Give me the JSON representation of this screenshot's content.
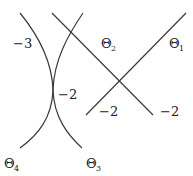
{
  "diagram": {
    "labels": {
      "left_region": "−3",
      "center_touch": "−2",
      "line_left_end": "−2",
      "line_right_end": "−2",
      "theta1": {
        "base": "Θ",
        "sub": "1"
      },
      "theta2": {
        "base": "Θ",
        "sub": "2"
      },
      "theta3": {
        "base": "Θ",
        "sub": "3"
      },
      "theta4": {
        "base": "Θ",
        "sub": "4"
      }
    },
    "stroke_color": "#3a3a3a",
    "background": "#ffffff"
  }
}
